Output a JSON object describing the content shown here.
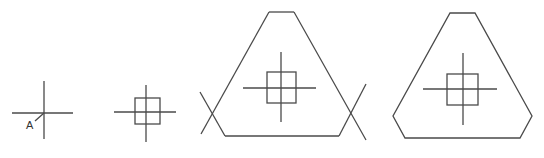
{
  "diagram": {
    "stroke_color": "#4a4a4a",
    "background": "#ffffff",
    "figures": [
      {
        "id": "step-1",
        "label": "A",
        "crosshair": {
          "cx": 44,
          "cy": 113,
          "h": [
            12,
            73
          ],
          "v": [
            81,
            139
          ]
        },
        "leader": {
          "x1": 35,
          "y1": 121,
          "x2": 44,
          "y2": 113
        }
      },
      {
        "id": "step-2",
        "crosshair": {
          "cx": 146,
          "cy": 112,
          "h": [
            114,
            176
          ],
          "v": [
            85,
            142
          ]
        },
        "square": {
          "x": 135,
          "y": 98,
          "w": 25,
          "h": 26
        }
      },
      {
        "id": "step-3",
        "crosshair": {
          "cx": 281,
          "cy": 88,
          "h": [
            243,
            316
          ],
          "v": [
            52,
            122
          ]
        },
        "square": {
          "x": 267,
          "y": 72,
          "w": 29,
          "h": 31
        }
      },
      {
        "id": "step-4",
        "crosshair": {
          "cx": 463,
          "cy": 89,
          "h": [
            423,
            497
          ],
          "v": [
            53,
            125
          ]
        },
        "square": {
          "x": 447,
          "y": 74,
          "w": 31,
          "h": 31
        }
      }
    ]
  }
}
